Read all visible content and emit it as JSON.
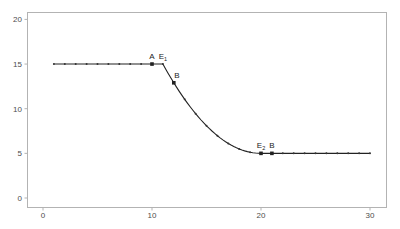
{
  "chart_data": {
    "type": "line",
    "title": "",
    "xlabel": "",
    "ylabel": "",
    "xlim": [
      -1.5,
      31.5
    ],
    "ylim": [
      -1,
      21
    ],
    "x_ticks": [
      0,
      10,
      20,
      30
    ],
    "y_ticks": [
      0,
      5,
      10,
      15,
      20
    ],
    "grid": false,
    "legend": null,
    "series": [
      {
        "name": "curve",
        "x": [
          1,
          2,
          3,
          4,
          5,
          6,
          7,
          8,
          9,
          10,
          11,
          12,
          13,
          14,
          15,
          16,
          17,
          18,
          19,
          20,
          21,
          22,
          23,
          24,
          25,
          26,
          27,
          28,
          29,
          30
        ],
        "y": [
          15,
          15,
          15,
          15,
          15,
          15,
          15,
          15,
          15,
          15,
          15,
          12.9,
          11.05,
          9.44,
          8.09,
          6.98,
          6.11,
          5.49,
          5.12,
          5,
          5,
          5,
          5,
          5,
          5,
          5,
          5,
          5,
          5,
          5
        ]
      }
    ],
    "annotations": [
      {
        "label": "A",
        "x": 10,
        "y": 15,
        "marker": true
      },
      {
        "label": "E1",
        "x": 11,
        "y": 15,
        "marker": false
      },
      {
        "label": "B",
        "x": 12,
        "y": 12.9,
        "marker": true
      },
      {
        "label": "E2",
        "x": 20,
        "y": 5,
        "marker": true
      },
      {
        "label": "B",
        "x": 21,
        "y": 5,
        "marker": true
      }
    ]
  }
}
